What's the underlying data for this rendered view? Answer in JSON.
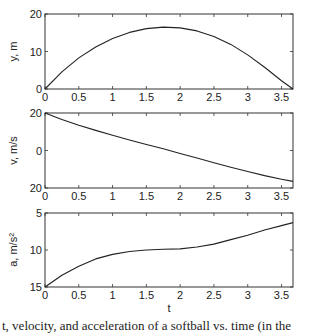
{
  "chart_data": [
    {
      "type": "line",
      "title": "",
      "xlabel": "",
      "ylabel": "y, m",
      "xlim": [
        0,
        3.67
      ],
      "ylim": [
        0,
        20
      ],
      "y_reversed": false,
      "xticks": [
        "0",
        "0.5",
        "1",
        "1.5",
        "2",
        "2.5",
        "3",
        "3.5"
      ],
      "yticks": [
        "0",
        "10",
        "20"
      ],
      "grid": false,
      "series": [
        {
          "name": "height",
          "x": [
            0,
            0.25,
            0.5,
            0.75,
            1.0,
            1.25,
            1.5,
            1.75,
            2.0,
            2.25,
            2.5,
            2.75,
            3.0,
            3.25,
            3.5,
            3.67
          ],
          "values": [
            0,
            4.6,
            8.3,
            11.2,
            13.5,
            15.1,
            16.1,
            16.5,
            16.3,
            15.5,
            14.0,
            11.9,
            9.1,
            5.8,
            2.2,
            0
          ]
        }
      ]
    },
    {
      "type": "line",
      "title": "",
      "xlabel": "",
      "ylabel": "v, m/s",
      "xlim": [
        0,
        3.67
      ],
      "ylim": [
        -20,
        20
      ],
      "y_reversed": false,
      "xticks": [
        "0",
        "0.5",
        "1",
        "1.5",
        "2",
        "2.5",
        "3",
        "3.5"
      ],
      "yticks": [
        "20",
        "0",
        "20"
      ],
      "grid": false,
      "series": [
        {
          "name": "velocity",
          "x": [
            0,
            0.25,
            0.5,
            0.75,
            1.0,
            1.25,
            1.5,
            1.75,
            2.0,
            2.25,
            2.5,
            2.75,
            3.0,
            3.25,
            3.5,
            3.67
          ],
          "values": [
            20,
            16.6,
            13.5,
            10.7,
            8.1,
            5.6,
            3.2,
            0.9,
            -1.6,
            -4.0,
            -6.5,
            -8.9,
            -11.2,
            -13.4,
            -15.3,
            -16.5
          ]
        }
      ]
    },
    {
      "type": "line",
      "title": "",
      "xlabel": "t",
      "ylabel": "a, m/s²",
      "xlim": [
        0,
        3.67
      ],
      "ylim": [
        15,
        5
      ],
      "y_reversed": true,
      "xticks": [
        "0",
        "0.5",
        "1",
        "1.5",
        "2",
        "2.5",
        "3",
        "3.5"
      ],
      "yticks": [
        "5",
        "10",
        "15"
      ],
      "grid": false,
      "series": [
        {
          "name": "acceleration",
          "x": [
            0,
            0.25,
            0.5,
            0.75,
            1.0,
            1.25,
            1.5,
            1.75,
            2.0,
            2.25,
            2.5,
            2.75,
            3.0,
            3.25,
            3.5,
            3.67
          ],
          "values": [
            15,
            13.4,
            12.2,
            11.2,
            10.6,
            10.2,
            10.0,
            9.9,
            9.85,
            9.6,
            9.2,
            8.6,
            8.0,
            7.3,
            6.7,
            6.3
          ]
        }
      ]
    }
  ],
  "caption": "t, velocity, and acceleration of a softball vs. time (in the"
}
